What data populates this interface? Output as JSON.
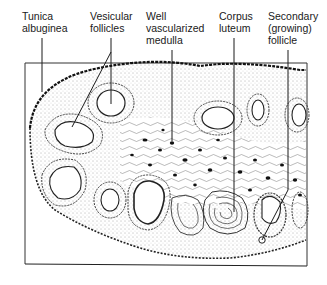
{
  "figure": {
    "colors": {
      "ink": "#1a1a1a",
      "background": "#ffffff",
      "frame": "#333333"
    }
  },
  "labels": [
    {
      "id": "tunica-albuginea",
      "text": "Tunica\nalbuginea",
      "x": 22,
      "y": 10
    },
    {
      "id": "vesicular-follicles",
      "text": "Vesicular\nfollicles",
      "x": 90,
      "y": 10
    },
    {
      "id": "well-vascularized-medulla",
      "text": "Well\nvascularized\nmedulla",
      "x": 146,
      "y": 10
    },
    {
      "id": "corpus-luteum",
      "text": "Corpus\nluteum",
      "x": 219,
      "y": 10
    },
    {
      "id": "secondary-follicle",
      "text": "Secondary\n(growing)\nfollicle",
      "x": 268,
      "y": 10
    }
  ]
}
